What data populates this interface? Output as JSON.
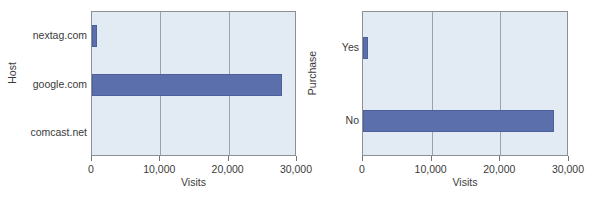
{
  "chart_data": [
    {
      "type": "bar",
      "orientation": "horizontal",
      "title": "",
      "xlabel": "Visits",
      "ylabel": "Host",
      "categories": [
        "nextag.com",
        "google.com",
        "comcast.net"
      ],
      "values": [
        700,
        27800,
        0
      ],
      "xlim": [
        0,
        30000
      ],
      "xticks": [
        0,
        10000,
        20000,
        30000
      ],
      "xticklabels": [
        "0",
        "10,000",
        "20,000",
        "30,000"
      ],
      "grid": true,
      "gridlines_at": [
        10000,
        20000
      ],
      "legend": null,
      "bar_color": "#5b6fad",
      "panel_color": "#e2eaf4"
    },
    {
      "type": "bar",
      "orientation": "horizontal",
      "title": "",
      "xlabel": "Visits",
      "ylabel": "Purchase",
      "categories": [
        "Yes",
        "No"
      ],
      "values": [
        700,
        27800
      ],
      "xlim": [
        0,
        30000
      ],
      "xticks": [
        0,
        10000,
        20000,
        30000
      ],
      "xticklabels": [
        "0",
        "10,000",
        "20,000",
        "30,000"
      ],
      "grid": true,
      "gridlines_at": [
        10000,
        20000
      ],
      "legend": null,
      "bar_color": "#5b6fad",
      "panel_color": "#e2eaf4"
    }
  ]
}
